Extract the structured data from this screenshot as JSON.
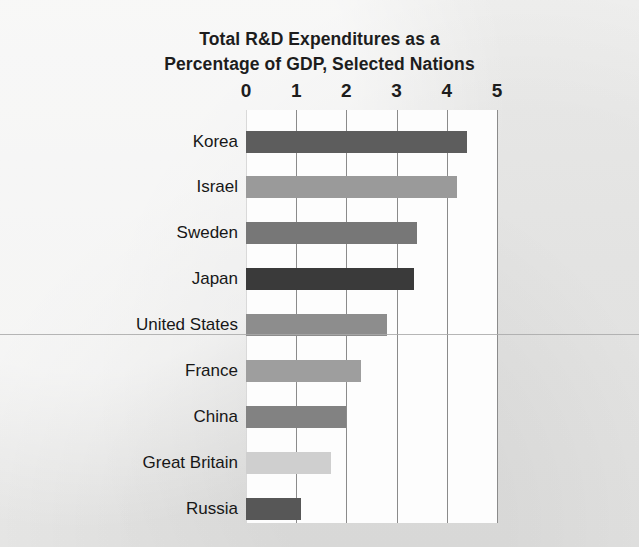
{
  "chart_data": {
    "type": "bar",
    "orientation": "horizontal",
    "title": "Total R&D Expenditures as a Percentage of GDP, Selected Nations",
    "title_lines": [
      "Total R&D Expenditures as a",
      "Percentage of GDP, Selected Nations"
    ],
    "xlabel": "",
    "ylabel": "",
    "xlim": [
      0,
      5
    ],
    "xticks": [
      "0",
      "1",
      "2",
      "3",
      "4",
      "5"
    ],
    "xtick_values": [
      0,
      1,
      2,
      3,
      4,
      5
    ],
    "grid": "vertical",
    "legend": "none",
    "axis_position": "top",
    "categories": [
      "Korea",
      "Israel",
      "Sweden",
      "Japan",
      "United States",
      "France",
      "China",
      "Great Britain",
      "Russia"
    ],
    "values": [
      4.4,
      4.2,
      3.4,
      3.35,
      2.8,
      2.3,
      2.0,
      1.7,
      1.1
    ],
    "bar_colors": [
      "#5d5d5d",
      "#9a9a9a",
      "#777777",
      "#3a3a3a",
      "#8d8d8d",
      "#9e9e9e",
      "#828282",
      "#cfcfcf",
      "#575757"
    ],
    "bars": [
      {
        "label": "Korea",
        "value": 4.4,
        "color": "#5d5d5d"
      },
      {
        "label": "Israel",
        "value": 4.2,
        "color": "#9a9a9a"
      },
      {
        "label": "Sweden",
        "value": 3.4,
        "color": "#777777"
      },
      {
        "label": "Japan",
        "value": 3.35,
        "color": "#3a3a3a"
      },
      {
        "label": "United States",
        "value": 2.8,
        "color": "#8d8d8d"
      },
      {
        "label": "France",
        "value": 2.3,
        "color": "#9e9e9e"
      },
      {
        "label": "China",
        "value": 2.0,
        "color": "#828282"
      },
      {
        "label": "Great Britain",
        "value": 1.7,
        "color": "#cfcfcf"
      },
      {
        "label": "Russia",
        "value": 1.1,
        "color": "#575757"
      }
    ]
  },
  "style": {
    "page_background": "#ececeb",
    "plot_background": "#fdfdfd",
    "gridline_color": "#8b8b8b",
    "text_color": "#1d1d1d",
    "rule_color": "#a9a9a9"
  }
}
